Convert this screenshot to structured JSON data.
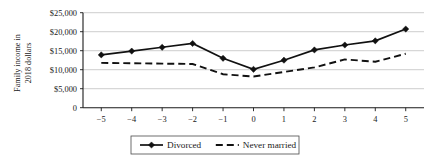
{
  "chart_data": {
    "type": "line",
    "title": "",
    "xlabel": "",
    "ylabel": "Family income in 2018 dollars",
    "ylabel_line1": "Family income in",
    "ylabel_line2": "2018 dollars",
    "x": [
      -5,
      -4,
      -3,
      -2,
      -1,
      0,
      1,
      2,
      3,
      4,
      5
    ],
    "xtick_labels": [
      "−5",
      "−4",
      "−3",
      "−2",
      "−1",
      "0",
      "1",
      "2",
      "3",
      "4",
      "5"
    ],
    "ytick_labels": [
      "$25,000",
      "$20,000",
      "$15,000",
      "$10,000",
      "$5,000",
      "0"
    ],
    "ytick_values": [
      25000,
      20000,
      15000,
      10000,
      5000,
      0
    ],
    "ylim": [
      0,
      25000
    ],
    "xlim": [
      -5.6,
      5.6
    ],
    "grid": true,
    "legend_position": "bottom",
    "series": [
      {
        "name": "Divorced",
        "style": "solid",
        "marker": "diamond",
        "color": "#111111",
        "values": [
          13900,
          14900,
          15900,
          16900,
          13000,
          10100,
          12500,
          15200,
          16500,
          17600,
          20700
        ]
      },
      {
        "name": "Never married",
        "style": "dashed",
        "marker": "none",
        "color": "#111111",
        "values": [
          11800,
          11700,
          11600,
          11500,
          8800,
          8200,
          9400,
          10600,
          12700,
          12100,
          14200
        ]
      }
    ]
  },
  "legend": {
    "items": [
      {
        "label": "Divorced",
        "style": "solid",
        "marker": "diamond"
      },
      {
        "label": "Never married",
        "style": "dashed",
        "marker": "none"
      }
    ]
  }
}
